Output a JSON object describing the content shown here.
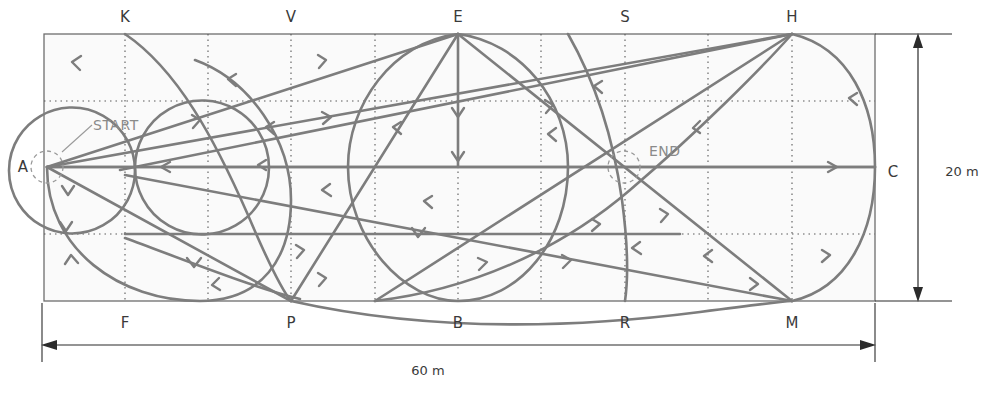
{
  "diagram": {
    "arena": {
      "width_label": "60 m",
      "height_label": "20 m",
      "width_meters": 60,
      "height_meters": 20
    },
    "markers": {
      "start": "START",
      "end": "END"
    },
    "letters": {
      "top": [
        {
          "id": "K",
          "label": "K",
          "x_m": 6
        },
        {
          "id": "V",
          "label": "V",
          "x_m": 18
        },
        {
          "id": "E",
          "label": "E",
          "x_m": 30
        },
        {
          "id": "S",
          "label": "S",
          "x_m": 42
        },
        {
          "id": "H",
          "label": "H",
          "x_m": 54
        }
      ],
      "bottom": [
        {
          "id": "F",
          "label": "F",
          "x_m": 6
        },
        {
          "id": "P",
          "label": "P",
          "x_m": 18
        },
        {
          "id": "B",
          "label": "B",
          "x_m": 30
        },
        {
          "id": "R",
          "label": "R",
          "x_m": 42
        },
        {
          "id": "M",
          "label": "M",
          "x_m": 54
        }
      ],
      "left": [
        {
          "id": "A",
          "label": "A",
          "y_m": 10
        }
      ],
      "right": [
        {
          "id": "C",
          "label": "C",
          "y_m": 10
        }
      ]
    },
    "colors": {
      "path": "#7d7d7d",
      "grid": "#5a5a5a",
      "arena_edge": "#6e6e6e",
      "arena_fill": "#fafafa",
      "label": "#3a3a3a",
      "marker_text": "#8a8a8a",
      "dimension": "#2b2b2b"
    }
  }
}
